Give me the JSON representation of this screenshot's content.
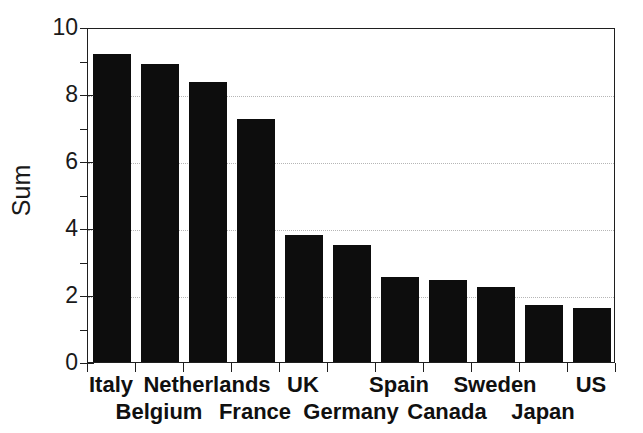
{
  "chart_data": {
    "type": "bar",
    "title": "",
    "subtitle": "",
    "xlabel": "",
    "ylabel": "Sum",
    "ylim": [
      0,
      10
    ],
    "xlim": [
      0,
      11
    ],
    "grid": true,
    "grid_axis": "y",
    "grid_style": "dotted",
    "legend": false,
    "legend_position": "none",
    "bar_color": "#0d0d0d",
    "categories": [
      "Italy",
      "Belgium",
      "Netherlands",
      "France",
      "UK",
      "Germany",
      "Spain",
      "Canada",
      "Sweden",
      "Japan",
      "US"
    ],
    "values": [
      9.2,
      8.9,
      8.35,
      7.25,
      3.8,
      3.5,
      2.55,
      2.45,
      2.25,
      1.7,
      1.6
    ],
    "y_ticks_major": [
      0,
      2,
      4,
      6,
      8,
      10
    ],
    "y_tick_labels": [
      "0",
      "2",
      "4",
      "6",
      "8",
      "10"
    ],
    "y_ticks_minor": [
      1,
      3,
      5,
      7,
      9
    ],
    "gridline_values": [
      2,
      4,
      6,
      8
    ],
    "label_rows": [
      0,
      1,
      0,
      1,
      0,
      1,
      0,
      1,
      0,
      1,
      0
    ]
  },
  "axis": {
    "y_title": "Sum"
  }
}
